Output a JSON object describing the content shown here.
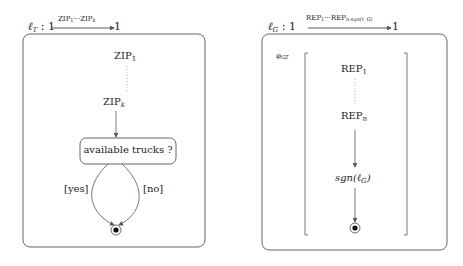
{
  "left": {
    "title": {
      "lvar": "ℓ",
      "lsub": "T",
      "sep": " : 1 ",
      "end": " 1",
      "arrow_label_a": "ZIP",
      "arrow_label_a_sub": "1",
      "arrow_label_mid": "···",
      "arrow_label_b": "ZIP",
      "arrow_label_b_sub": "k"
    },
    "nodes": {
      "zip_first": {
        "text": "ZIP",
        "sub": "1"
      },
      "zip_last": {
        "text": "ZIP",
        "sub": "k"
      },
      "decision": {
        "text": "available trucks ?"
      }
    },
    "edges": {
      "yes": "[yes]",
      "no": "[no]"
    }
  },
  "right": {
    "title": {
      "lvar": "ℓ",
      "lsub": "G",
      "sep": " : 1 ",
      "end": " 1",
      "arrow_label_a": "REP",
      "arrow_label_a_sub": "1",
      "arrow_label_mid": "···",
      "arrow_label_b": "REP",
      "arrow_label_b_sub": "n·sgn(ℓ_G)"
    },
    "guard": {
      "text": "φ",
      "sub": "GZ"
    },
    "nodes": {
      "rep_first": {
        "text": "REP",
        "sub": "1"
      },
      "rep_last": {
        "text": "REP",
        "sub": "n"
      },
      "sgn": {
        "text": "sgn(ℓ",
        "sub": "G",
        "close": ")"
      }
    }
  },
  "colors": {
    "stroke": "#555555",
    "text": "#222222",
    "dotted": "#999999"
  }
}
